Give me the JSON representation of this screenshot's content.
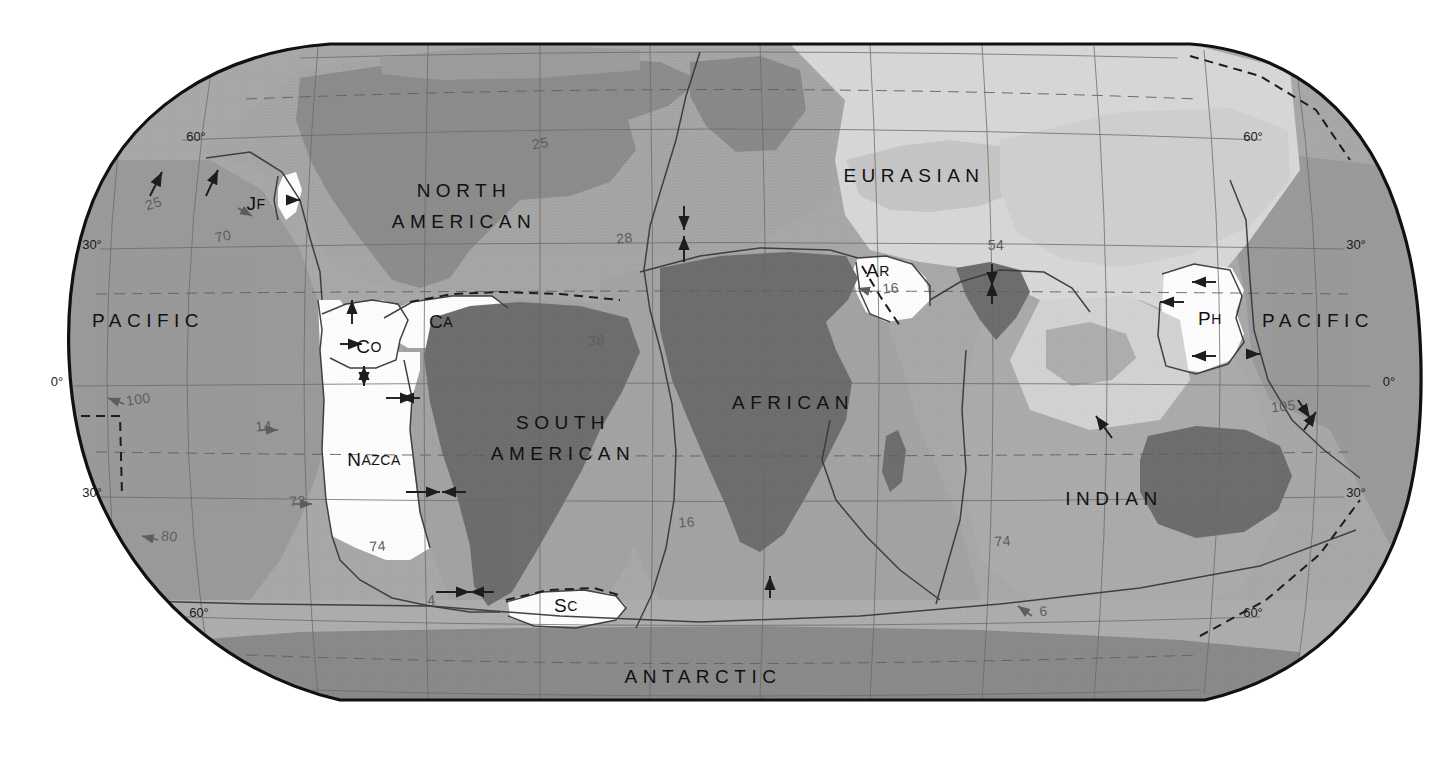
{
  "map": {
    "title": "Tectonic Plates of the World",
    "projection": "robinson",
    "background_color": "#ffffff",
    "border_color": "#111111"
  },
  "colors": {
    "ocean_pacific": "#9a9a9a",
    "ocean_mid": "#a8a8a8",
    "ocean_light": "#b8b8b8",
    "plate_eurasian": "#d8d8d8",
    "plate_white": "#fdfdfd",
    "continent_dark": "#6d6d6d",
    "continent_mid": "#7e7e7e",
    "continent_light": "#8d8d8d",
    "graticule": "#6a6a6a",
    "boundary": "#3a3a3a",
    "velocity_text": "#5d5d5d",
    "label_text": "#111111"
  },
  "plates": [
    {
      "id": "pacific_west",
      "label": "PACIFIC",
      "style": "major",
      "x": 148,
      "y": 322
    },
    {
      "id": "pacific_east",
      "label": "PACIFIC",
      "style": "major",
      "x": 1318,
      "y": 322
    },
    {
      "id": "north_american",
      "label": "NORTH",
      "style": "major",
      "x": 464,
      "y": 192
    },
    {
      "id": "north_american2",
      "label": "AMERICAN",
      "style": "major",
      "x": 464,
      "y": 223
    },
    {
      "id": "south_american",
      "label": "SOUTH",
      "style": "major",
      "x": 563,
      "y": 424
    },
    {
      "id": "south_american2",
      "label": "AMERICAN",
      "style": "major",
      "x": 563,
      "y": 455
    },
    {
      "id": "african",
      "label": "AFRICAN",
      "style": "major",
      "x": 793,
      "y": 404
    },
    {
      "id": "eurasian",
      "label": "EURASIAN",
      "style": "major",
      "x": 914,
      "y": 177
    },
    {
      "id": "indian",
      "label": "INDIAN",
      "style": "major",
      "x": 1114,
      "y": 500
    },
    {
      "id": "antarctic",
      "label": "ANTARCTIC",
      "style": "major",
      "x": 703,
      "y": 678
    },
    {
      "id": "nazca",
      "label": "Nazca",
      "style": "small",
      "x": 374,
      "y": 461
    },
    {
      "id": "cocos",
      "label": "Co",
      "style": "small",
      "x": 369,
      "y": 348
    },
    {
      "id": "caribbean",
      "label": "Ca",
      "style": "small",
      "x": 441,
      "y": 323
    },
    {
      "id": "juan_de_fuca",
      "label": "JF",
      "style": "small",
      "x": 256,
      "y": 205
    },
    {
      "id": "scotia",
      "label": "Sc",
      "style": "small",
      "x": 566,
      "y": 607
    },
    {
      "id": "arabian",
      "label": "Ar",
      "style": "small",
      "x": 878,
      "y": 272
    },
    {
      "id": "philippine",
      "label": "PH",
      "style": "small",
      "x": 1210,
      "y": 320
    }
  ],
  "graticule_labels": {
    "left": [
      {
        "text": "60°",
        "x": 196,
        "y": 141
      },
      {
        "text": "30°",
        "x": 92,
        "y": 249
      },
      {
        "text": "0°",
        "x": 57,
        "y": 386
      },
      {
        "text": "30°",
        "x": 92,
        "y": 497
      },
      {
        "text": "60°",
        "x": 199,
        "y": 617
      }
    ],
    "right": [
      {
        "text": "60°",
        "x": 1253,
        "y": 141
      },
      {
        "text": "30°",
        "x": 1356,
        "y": 249
      },
      {
        "text": "0°",
        "x": 1389,
        "y": 386
      },
      {
        "text": "30°",
        "x": 1356,
        "y": 497
      },
      {
        "text": "60°",
        "x": 1253,
        "y": 617
      }
    ]
  },
  "velocities": [
    {
      "value": "25",
      "x": 155,
      "y": 208,
      "angle": -18
    },
    {
      "value": "70",
      "x": 224,
      "y": 241,
      "angle": -12
    },
    {
      "value": "100",
      "x": 139,
      "y": 404,
      "angle": -8
    },
    {
      "value": "80",
      "x": 169,
      "y": 541,
      "angle": 6
    },
    {
      "value": "25",
      "x": 541,
      "y": 148,
      "angle": -8
    },
    {
      "value": "28",
      "x": 625,
      "y": 243,
      "angle": -6
    },
    {
      "value": "38",
      "x": 597,
      "y": 345,
      "angle": -5
    },
    {
      "value": "14",
      "x": 264,
      "y": 431,
      "angle": -4
    },
    {
      "value": "73",
      "x": 298,
      "y": 506,
      "angle": -4
    },
    {
      "value": "74",
      "x": 378,
      "y": 551,
      "angle": -4
    },
    {
      "value": "4",
      "x": 432,
      "y": 605,
      "angle": -4
    },
    {
      "value": "16",
      "x": 687,
      "y": 527,
      "angle": -4
    },
    {
      "value": "16",
      "x": 891,
      "y": 293,
      "angle": -4
    },
    {
      "value": "54",
      "x": 996,
      "y": 250,
      "angle": 0
    },
    {
      "value": "74",
      "x": 1003,
      "y": 546,
      "angle": -4
    },
    {
      "value": "6",
      "x": 1044,
      "y": 616,
      "angle": -4
    },
    {
      "value": "105",
      "x": 1284,
      "y": 411,
      "angle": -6
    }
  ],
  "arrows": {
    "count": 18,
    "description": "plate motion direction arrows"
  }
}
